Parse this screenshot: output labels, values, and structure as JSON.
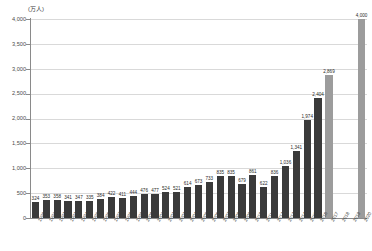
{
  "chart_data": {
    "type": "bar",
    "title": "",
    "subtitle": "",
    "unit_label": "(万人)",
    "xlabel": "",
    "ylabel": "",
    "ylim": [
      0,
      4000
    ],
    "grid": true,
    "legend": "none",
    "ytick_labels": [
      "4,000",
      "3,500",
      "3,000",
      "2,500",
      "2,000",
      "1,500",
      "1,000",
      "500",
      "0"
    ],
    "ytick_values": [
      4000,
      3500,
      3000,
      2500,
      2000,
      1500,
      1000,
      500,
      0
    ],
    "categories": [
      "1990",
      "1991",
      "1992",
      "1993",
      "1994",
      "1995",
      "1996",
      "1997",
      "1998",
      "1999",
      "2000",
      "2001",
      "2002",
      "2003",
      "2004",
      "2005",
      "2006",
      "2007",
      "2008",
      "2009",
      "2010",
      "2011",
      "2012",
      "2013",
      "2014",
      "2015",
      "2016",
      "2017",
      "2018",
      "2019",
      "2020"
    ],
    "values": [
      324,
      353,
      358,
      341,
      347,
      335,
      384,
      422,
      411,
      444,
      476,
      477,
      524,
      521,
      614,
      673,
      733,
      835,
      835,
      679,
      861,
      622,
      836,
      1036,
      1341,
      1974,
      2404,
      2869,
      null,
      null,
      4000
    ],
    "value_labels": [
      "324",
      "353",
      "358",
      "341",
      "347",
      "335",
      "384",
      "422",
      "411",
      "444",
      "476",
      "477",
      "524",
      "521",
      "614",
      "673",
      "733",
      "835",
      "835",
      "679",
      "861",
      "622",
      "836",
      "1,036",
      "1,341",
      "1,974",
      "2,404",
      "2,869",
      "",
      "",
      "4,000"
    ],
    "bar_styles": [
      "primary",
      "primary",
      "primary",
      "primary",
      "primary",
      "primary",
      "primary",
      "primary",
      "primary",
      "primary",
      "primary",
      "primary",
      "primary",
      "primary",
      "primary",
      "primary",
      "primary",
      "primary",
      "primary",
      "primary",
      "primary",
      "primary",
      "primary",
      "primary",
      "primary",
      "primary",
      "primary",
      "alt",
      "none",
      "none",
      "alt"
    ],
    "colors": {
      "primary": "#3a3a3a",
      "alt": "#9c9c9c",
      "grid": "#d9d9d9",
      "axis": "#8a8a8a",
      "text": "#2b2b2b"
    }
  }
}
